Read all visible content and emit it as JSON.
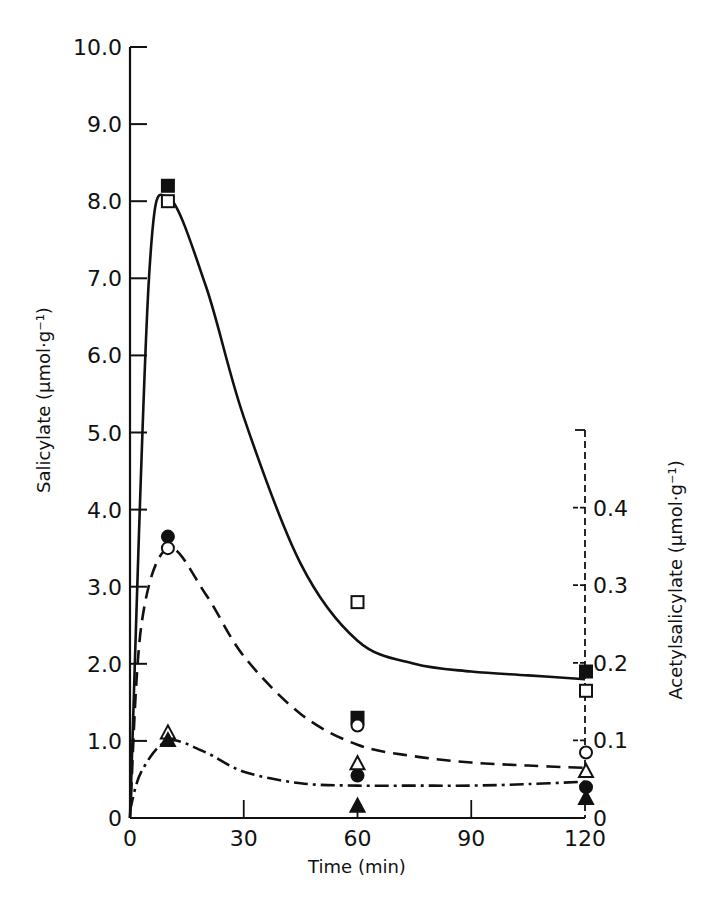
{
  "chart_data": {
    "type": "line",
    "title": "",
    "xlabel": "Time (min)",
    "ylabel": "Salicylate (μmol·g⁻¹)",
    "y2label": "Acetylsalicylate (μmol·g⁻¹)",
    "xlim": [
      0,
      120
    ],
    "ylim": [
      0,
      10.0
    ],
    "y2lim": [
      0,
      0.5
    ],
    "grid": false,
    "legend": "none",
    "x_ticks": [
      "0",
      "30",
      "60",
      "90",
      "120"
    ],
    "y_ticks": [
      "0",
      "1.0",
      "2.0",
      "3.0",
      "4.0",
      "5.0",
      "6.0",
      "7.0",
      "8.0",
      "9.0",
      "10.0"
    ],
    "y2_ticks": [
      "0",
      "0.1",
      "0.2",
      "0.3",
      "0.4"
    ],
    "x": [
      10,
      60,
      120
    ],
    "series": [
      {
        "name": "filled-square",
        "marker": "square-filled",
        "values": [
          8.2,
          1.3,
          1.9
        ]
      },
      {
        "name": "open-square",
        "marker": "square-open",
        "values": [
          8.0,
          2.8,
          1.65
        ]
      },
      {
        "name": "filled-circle",
        "marker": "circle-filled",
        "values": [
          3.65,
          0.55,
          0.4
        ]
      },
      {
        "name": "open-circle",
        "marker": "circle-open",
        "values": [
          3.5,
          1.2,
          0.85
        ]
      },
      {
        "name": "open-triangle",
        "marker": "triangle-open",
        "values": [
          1.1,
          0.7,
          0.6
        ]
      },
      {
        "name": "filled-triangle",
        "marker": "triangle-filled",
        "values": [
          1.0,
          0.15,
          0.25
        ]
      }
    ],
    "fitted_curves": [
      {
        "name": "solid-curve",
        "style": "solid",
        "x": [
          0,
          5,
          10,
          20,
          30,
          45,
          60,
          75,
          90,
          105,
          120
        ],
        "y": [
          0,
          7.0,
          8.05,
          6.9,
          5.2,
          3.3,
          2.3,
          2.0,
          1.9,
          1.85,
          1.8
        ]
      },
      {
        "name": "dashed-curve",
        "style": "dashed",
        "x": [
          0,
          3,
          10,
          20,
          30,
          45,
          60,
          75,
          90,
          105,
          120
        ],
        "y": [
          0,
          2.5,
          3.5,
          2.9,
          2.1,
          1.35,
          0.95,
          0.8,
          0.72,
          0.68,
          0.65
        ]
      },
      {
        "name": "dash-dot-curve",
        "style": "dash-dot",
        "x": [
          0,
          3,
          10,
          20,
          30,
          45,
          60,
          75,
          90,
          105,
          120
        ],
        "y": [
          0.1,
          0.6,
          1.0,
          0.85,
          0.6,
          0.45,
          0.42,
          0.42,
          0.42,
          0.44,
          0.47
        ]
      }
    ]
  }
}
